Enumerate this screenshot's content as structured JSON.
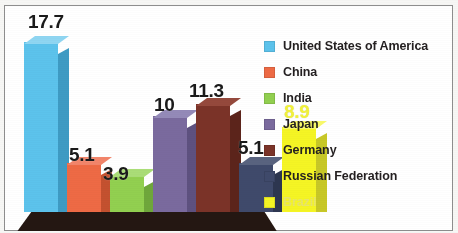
{
  "chart_data": {
    "type": "bar",
    "title": "",
    "subtitle": "",
    "xlabel": "",
    "ylabel": "",
    "categories": [
      "United States of America",
      "China",
      "India",
      "Japan",
      "Germany",
      "Russian Federation",
      "Brazil"
    ],
    "values": [
      17.7,
      5.1,
      3.9,
      10,
      11.3,
      5.1,
      8.9
    ],
    "value_labels": [
      "17.7",
      "5.1",
      "3.9",
      "10",
      "11.3",
      "5.1",
      "8.9"
    ],
    "colors": [
      "#5CC3EC",
      "#EE6A45",
      "#92D050",
      "#7A6A9E",
      "#7B3328",
      "#3F4A6B",
      "#F5F524"
    ],
    "side_colors": [
      "#3E9BC4",
      "#C4512F",
      "#6FA73B",
      "#5E5180",
      "#5C241B",
      "#2D3650",
      "#C8C827"
    ],
    "top_colors": [
      "#8FD6F2",
      "#F2856A",
      "#AADD77",
      "#948AB8",
      "#95493C",
      "#59637F",
      "#F9F96A"
    ],
    "ylim": [
      0,
      20
    ],
    "grid": false,
    "legend_position": "right",
    "style": "3d-column",
    "annotations": []
  },
  "legend": {
    "items": [
      {
        "label": "United States of America",
        "color": "#5CC3EC",
        "faded": false
      },
      {
        "label": "China",
        "color": "#EE6A45",
        "faded": false
      },
      {
        "label": "India",
        "color": "#92D050",
        "faded": false
      },
      {
        "label": "Japan",
        "color": "#7A6A9E",
        "faded": false
      },
      {
        "label": "Germany",
        "color": "#7B3328",
        "faded": false
      },
      {
        "label": "Russian Federation",
        "color": "#3F4A6B",
        "faded": false
      },
      {
        "label": "Brazil",
        "color": "#F5F524",
        "faded": true
      }
    ]
  },
  "floor": {
    "color": "#241712",
    "edge_color": "#3B2A22"
  },
  "frame": {
    "border_color": "#8E8E8E",
    "background": "#FFFFFF"
  }
}
